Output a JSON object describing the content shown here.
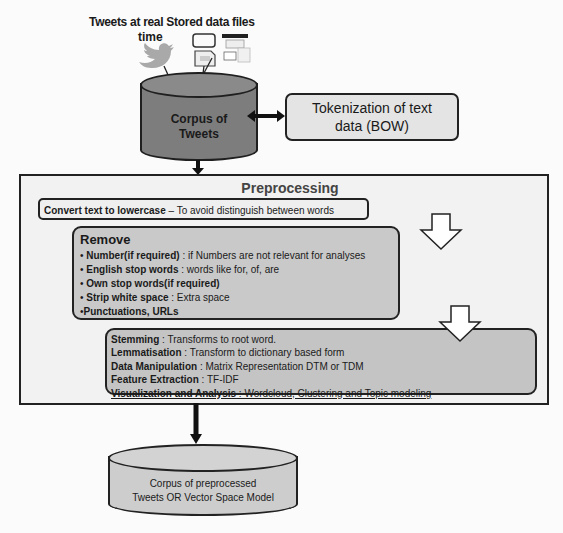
{
  "sources": {
    "twitter_label_line1": "Tweets at real",
    "twitter_label_line2": "time",
    "stored_label": "Stored data files",
    "twitter_icon": "twitter-bird-icon",
    "files_icon": "document-files-icon"
  },
  "corpus": {
    "label_line1": "Corpus of",
    "label_line2": "Tweets"
  },
  "tokenization": {
    "line1": "Tokenization of text",
    "line2": "data (BOW)"
  },
  "preprocessing": {
    "title": "Preprocessing",
    "lowercase": {
      "bold": "Convert text to lowercase",
      "rest": " – To avoid distinguish between words"
    },
    "remove": {
      "title": "Remove",
      "items": [
        {
          "bullet": "• ",
          "bold": "Number(if required)",
          "rest": " : if Numbers  are not relevant for analyses"
        },
        {
          "bullet": "• ",
          "bold": "English stop words",
          "rest": " : words like for, of, are"
        },
        {
          "bullet": "• ",
          "bold": "Own stop words(if required)",
          "rest": ""
        },
        {
          "bullet": "• ",
          "bold": "Strip white space",
          "rest": "  : Extra space"
        },
        {
          "bullet": "•",
          "bold": "Punctuations, URLs",
          "rest": ""
        }
      ]
    },
    "steps": [
      {
        "bold": "Stemming",
        "rest": " : Transforms to root word."
      },
      {
        "bold": "Lemmatisation",
        "rest": " : Transform to dictionary based form"
      },
      {
        "bold": "Data Manipulation",
        "rest": " :  Matrix Representation DTM or TDM"
      },
      {
        "bold": "Feature Extraction",
        "rest": " : TF-IDF"
      },
      {
        "bold": "Visualization and Analysis",
        "rest": " : Wordcloud, Clustering and Topic modeling"
      }
    ]
  },
  "output_corpus": {
    "line1": "Corpus of preprocessed",
    "line2": "Tweets OR Vector Space Model"
  },
  "colors": {
    "corpus_fill": "#7d7d7d",
    "box_stroke": "#222222",
    "remove_fill": "#c9c9c9",
    "steps_fill": "#c4c4c4",
    "token_fill": "#e4e4e4"
  }
}
